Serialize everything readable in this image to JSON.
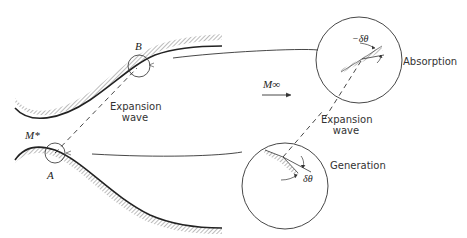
{
  "diagram": {
    "labels": {
      "point_b": "B",
      "point_a": "A",
      "throat_mach": "M*",
      "freestream_mach": "M∞",
      "left_wave_line1": "Expansion",
      "left_wave_line2": "wave",
      "right_wave_line1": "Expansion",
      "right_wave_line2": "wave",
      "absorption": "Absorption",
      "generation": "Generation",
      "neg_delta_theta": "−δθ",
      "delta_theta": "δθ"
    },
    "colors": {
      "stroke": "#222222",
      "hatch": "#888888",
      "background": "#ffffff"
    }
  }
}
